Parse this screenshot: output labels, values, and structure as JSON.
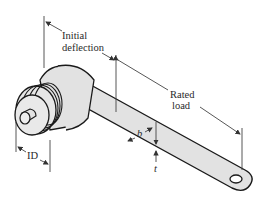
{
  "diagram": {
    "colors": {
      "stroke": "#1a1a1a",
      "fill": "#e2e2e2",
      "dimension_line": "#444444",
      "text": "#2a2a2a"
    },
    "labels": {
      "initial_deflection_line1": "Initial",
      "initial_deflection_line2": "deflection",
      "rated_load_line1": "Rated",
      "rated_load_line2": "load",
      "width": "b",
      "thickness": "t",
      "inner_diameter": "ID"
    }
  }
}
